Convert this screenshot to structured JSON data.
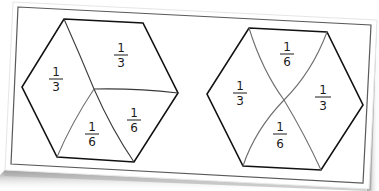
{
  "figure": {
    "colors": {
      "paper": "#ffffff",
      "border": "#555555",
      "outline": "#111111",
      "divider": "#6e6e6e",
      "shadow": "#9a9a9a"
    },
    "hexagons": [
      {
        "id": "left",
        "regions": [
          {
            "numerator": "1",
            "denominator": "3",
            "position": "left"
          },
          {
            "numerator": "1",
            "denominator": "3",
            "position": "top"
          },
          {
            "numerator": "1",
            "denominator": "6",
            "position": "bottom-right"
          },
          {
            "numerator": "1",
            "denominator": "6",
            "position": "bottom"
          }
        ]
      },
      {
        "id": "right",
        "regions": [
          {
            "numerator": "1",
            "denominator": "6",
            "position": "top"
          },
          {
            "numerator": "1",
            "denominator": "3",
            "position": "left"
          },
          {
            "numerator": "1",
            "denominator": "3",
            "position": "right"
          },
          {
            "numerator": "1",
            "denominator": "6",
            "position": "bottom"
          }
        ]
      }
    ]
  }
}
